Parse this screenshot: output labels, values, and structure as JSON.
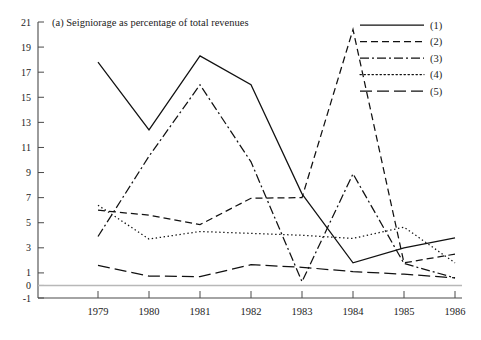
{
  "chart_data": {
    "type": "line",
    "title": "(a)  Seigniorage as percentage of total revenues",
    "xlabel": "",
    "ylabel": "",
    "grid": false,
    "legend_position": "top-right",
    "x": [
      "1979",
      "1980",
      "1981",
      "1982",
      "1983",
      "1984",
      "1985",
      "1986"
    ],
    "categories": [
      "1979",
      "1980",
      "1981",
      "1982",
      "1983",
      "1984",
      "1985",
      "1986"
    ],
    "xlim": [
      1979,
      1986
    ],
    "ylim": [
      -1,
      21
    ],
    "ytick_labels": [
      "21",
      "19",
      "17",
      "15",
      "13",
      "11",
      "9",
      "7",
      "5",
      "3",
      "1",
      "0",
      "-1"
    ],
    "yticks": [
      21,
      19,
      17,
      15,
      13,
      11,
      9,
      7,
      5,
      3,
      1,
      0,
      -1
    ],
    "xtick_labels": [
      "1979",
      "1980",
      "1981",
      "1982",
      "1983",
      "1984",
      "1985",
      "1986"
    ],
    "zero_reference_line": 0,
    "series": [
      {
        "name": "(1)",
        "style": "solid",
        "values": [
          17.8,
          12.4,
          18.3,
          16.0,
          7.3,
          1.8,
          3.0,
          3.8
        ]
      },
      {
        "name": "(2)",
        "style": "dashed",
        "values": [
          6.0,
          5.6,
          4.85,
          6.95,
          7.0,
          20.4,
          1.8,
          2.5
        ]
      },
      {
        "name": "(3)",
        "style": "dash-dot",
        "values": [
          3.9,
          10.3,
          16.0,
          9.85,
          0.3,
          8.9,
          1.75,
          0.6
        ]
      },
      {
        "name": "(4)",
        "style": "dotted",
        "values": [
          6.4,
          3.7,
          4.3,
          4.15,
          4.0,
          3.75,
          4.65,
          1.8
        ]
      },
      {
        "name": "(5)",
        "style": "long-dash",
        "values": [
          1.6,
          0.75,
          0.7,
          1.65,
          1.45,
          1.1,
          0.9,
          0.6
        ]
      }
    ]
  },
  "legend": {
    "entries": [
      {
        "label": "(1)"
      },
      {
        "label": "(2)"
      },
      {
        "label": "(3)"
      },
      {
        "label": "(4)"
      },
      {
        "label": "(5)"
      }
    ]
  },
  "colors": {
    "ink": "#111111",
    "axis": "#4a4a4a",
    "zero_line": "#b8b8b8",
    "background": "#ffffff"
  }
}
